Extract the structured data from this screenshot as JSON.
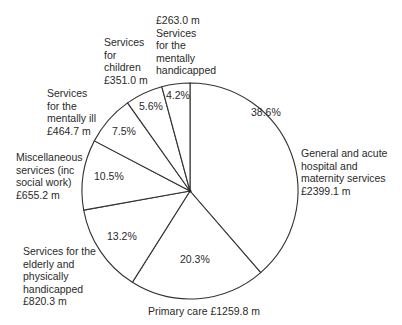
{
  "chart_data": {
    "type": "pie",
    "title": "",
    "start_angle": "top (12 o'clock), slices clockwise starting with General and acute",
    "slices": [
      {
        "label": "General and acute hospital and maternity services",
        "amount": "£2399.1 m",
        "value": 2399.1,
        "percent": 38.6
      },
      {
        "label": "Primary care",
        "amount": "£1259.8 m",
        "value": 1259.8,
        "percent": 20.3
      },
      {
        "label": "Services for the elderly and physically handicapped",
        "amount": "£820.3 m",
        "value": 820.3,
        "percent": 13.2
      },
      {
        "label": "Miscellaneous services (inc social work)",
        "amount": "£655.2 m",
        "value": 655.2,
        "percent": 10.5
      },
      {
        "label": "Services for the mentally ill",
        "amount": "£464.7 m",
        "value": 464.7,
        "percent": 7.5
      },
      {
        "label": "Services for children",
        "amount": "£351.0 m",
        "value": 351.0,
        "percent": 5.6
      },
      {
        "label": "Services for the mentally handicapped",
        "amount": "£263.0 m",
        "value": 263.0,
        "percent": 4.2
      }
    ],
    "colors": {
      "line": "#333333",
      "fill": "#ffffff",
      "text": "#2a2a2a"
    }
  },
  "labels": {
    "general": [
      "General and acute",
      "hospital and",
      "maternity services",
      "£2399.1 m"
    ],
    "primary": [
      "Primary care £1259.8 m"
    ],
    "elderly": [
      "Services for the",
      "elderly and",
      "physically",
      "handicapped",
      "£820.3 m"
    ],
    "misc": [
      "Miscellaneous",
      "services (inc",
      "social work)",
      "£655.2 m"
    ],
    "mentally_ill": [
      "Services",
      "for the",
      "mentally ill",
      "£464.7 m"
    ],
    "children": [
      "Services",
      "for",
      "children",
      "£351.0 m"
    ],
    "mentally_handicapped": [
      "£263.0 m",
      "Services",
      "for the",
      "mentally",
      "handicapped"
    ]
  },
  "percents": {
    "general": "38.6%",
    "primary": "20.3%",
    "elderly": "13.2%",
    "misc": "10.5%",
    "mentally_ill": "7.5%",
    "children": "5.6%",
    "mentally_handicapped": "4.2%"
  }
}
